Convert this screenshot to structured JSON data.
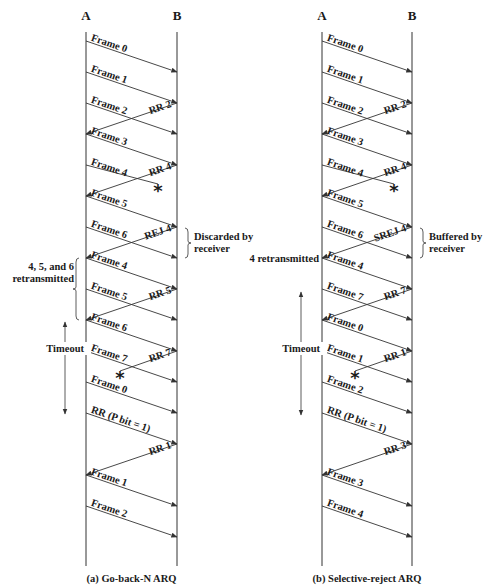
{
  "panels": [
    {
      "id": "a",
      "caption": "(a) Go-back-N ARQ",
      "station_a": "A",
      "station_b": "B",
      "xA": 86,
      "xB": 177,
      "messages": [
        {
          "label": "Frame 0",
          "dir": "AB",
          "y0": 41,
          "y1": 72
        },
        {
          "label": "Frame 1",
          "dir": "AB",
          "y0": 72,
          "y1": 103
        },
        {
          "label": "Frame 2",
          "dir": "AB",
          "y0": 103,
          "y1": 134
        },
        {
          "label": "RR 2",
          "dir": "BA",
          "y0": 103,
          "y1": 134
        },
        {
          "label": "Frame 3",
          "dir": "AB",
          "y0": 134,
          "y1": 165
        },
        {
          "label": "Frame 4",
          "dir": "AB",
          "y0": 165,
          "y1": 165,
          "lost": true,
          "lostX": 158,
          "lostY": 188
        },
        {
          "label": "RR 4",
          "dir": "BA",
          "y0": 165,
          "y1": 196
        },
        {
          "label": "Frame 5",
          "dir": "AB",
          "y0": 196,
          "y1": 227
        },
        {
          "label": "Frame 6",
          "dir": "AB",
          "y0": 227,
          "y1": 258
        },
        {
          "label": "REJ 4",
          "dir": "BA",
          "y0": 227,
          "y1": 258
        },
        {
          "label": "Frame 4",
          "dir": "AB",
          "y0": 258,
          "y1": 289
        },
        {
          "label": "Frame 5",
          "dir": "AB",
          "y0": 289,
          "y1": 320
        },
        {
          "label": "RR 5",
          "dir": "BA",
          "y0": 289,
          "y1": 320
        },
        {
          "label": "Frame 6",
          "dir": "AB",
          "y0": 320,
          "y1": 351
        },
        {
          "label": "Frame 7",
          "dir": "AB",
          "y0": 351,
          "y1": 382
        },
        {
          "label": "RR 7",
          "dir": "BA",
          "y0": 351,
          "y1": 351,
          "lost": true,
          "lostX": 120,
          "lostY": 375
        },
        {
          "label": "Frame 0",
          "dir": "AB",
          "y0": 382,
          "y1": 413
        },
        {
          "label": "RR (P bit = 1)",
          "dir": "AB",
          "y0": 413,
          "y1": 444
        },
        {
          "label": "RR 1",
          "dir": "BA",
          "y0": 444,
          "y1": 475
        },
        {
          "label": "Frame 1",
          "dir": "AB",
          "y0": 475,
          "y1": 506
        },
        {
          "label": "Frame 2",
          "dir": "AB",
          "y0": 506,
          "y1": 537
        }
      ],
      "annotations": [
        {
          "text": [
            "Discarded by",
            "receiver"
          ],
          "side": "right",
          "brace_y0": 228,
          "brace_y1": 258
        },
        {
          "text": [
            "4, 5, and 6",
            "retransmitted"
          ],
          "side": "left",
          "brace_y0": 258,
          "brace_y1": 320
        },
        {
          "text": [
            "Timeout"
          ],
          "side": "left-timeout",
          "arrow_y0": 322,
          "arrow_y1": 414,
          "label_y": 352
        }
      ]
    },
    {
      "id": "b",
      "caption": "(b) Selective-reject ARQ",
      "station_a": "A",
      "station_b": "B",
      "xA": 322,
      "xB": 412,
      "messages": [
        {
          "label": "Frame 0",
          "dir": "AB",
          "y0": 41,
          "y1": 72
        },
        {
          "label": "Frame 1",
          "dir": "AB",
          "y0": 72,
          "y1": 103
        },
        {
          "label": "Frame 2",
          "dir": "AB",
          "y0": 103,
          "y1": 134
        },
        {
          "label": "RR 2",
          "dir": "BA",
          "y0": 103,
          "y1": 134
        },
        {
          "label": "Frame 3",
          "dir": "AB",
          "y0": 134,
          "y1": 165
        },
        {
          "label": "Frame 4",
          "dir": "AB",
          "y0": 165,
          "y1": 165,
          "lost": true,
          "lostX": 394,
          "lostY": 188
        },
        {
          "label": "RR 4",
          "dir": "BA",
          "y0": 165,
          "y1": 196
        },
        {
          "label": "Frame 5",
          "dir": "AB",
          "y0": 196,
          "y1": 227
        },
        {
          "label": "Frame 6",
          "dir": "AB",
          "y0": 227,
          "y1": 258
        },
        {
          "label": "SREJ 4",
          "dir": "BA",
          "y0": 227,
          "y1": 258
        },
        {
          "label": "Frame 4",
          "dir": "AB",
          "y0": 258,
          "y1": 289
        },
        {
          "label": "Frame 7",
          "dir": "AB",
          "y0": 289,
          "y1": 320
        },
        {
          "label": "RR 7",
          "dir": "BA",
          "y0": 289,
          "y1": 320
        },
        {
          "label": "Frame 0",
          "dir": "AB",
          "y0": 320,
          "y1": 351
        },
        {
          "label": "Frame 1",
          "dir": "AB",
          "y0": 351,
          "y1": 382
        },
        {
          "label": "RR 1",
          "dir": "BA",
          "y0": 351,
          "y1": 351,
          "lost": true,
          "lostX": 355,
          "lostY": 375
        },
        {
          "label": "Frame 2",
          "dir": "AB",
          "y0": 382,
          "y1": 413
        },
        {
          "label": "RR (P bit = 1)",
          "dir": "AB",
          "y0": 413,
          "y1": 444
        },
        {
          "label": "RR 3",
          "dir": "BA",
          "y0": 444,
          "y1": 475
        },
        {
          "label": "Frame 3",
          "dir": "AB",
          "y0": 475,
          "y1": 506
        },
        {
          "label": "Frame 4",
          "dir": "AB",
          "y0": 506,
          "y1": 537
        }
      ],
      "annotations": [
        {
          "text": [
            "Buffered by",
            "receiver"
          ],
          "side": "right",
          "brace_y0": 228,
          "brace_y1": 258
        },
        {
          "text": [
            "4 retransmitted"
          ],
          "side": "left-plain",
          "label_y": 262
        },
        {
          "text": [
            "Timeout"
          ],
          "side": "left-timeout",
          "arrow_y0": 292,
          "arrow_y1": 415,
          "label_y": 352
        }
      ]
    }
  ],
  "lost_marker": "*",
  "colors": {
    "line": "#333333",
    "text": "#1a1a1a",
    "background": "#ffffff"
  }
}
